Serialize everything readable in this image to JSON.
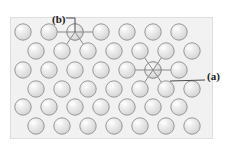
{
  "figure": {
    "kind": "atomic-lattice-diagram",
    "width": 231,
    "height": 156,
    "background_color": "#ffffff",
    "panel": {
      "x": 10,
      "y": 17,
      "width": 203,
      "height": 122,
      "fill_color": "#ebebeb",
      "border_color": "#cdcdcd",
      "texture": "fine vertical paper grain"
    }
  },
  "atoms": {
    "count": 41,
    "radius": 8.2,
    "fill_color": "#e2e2e2",
    "outline_color": "#8f8f8f",
    "highlight_color": "#fbfbfb",
    "lattice_type": "hexagonal close packed (2D)",
    "row_spacing": 19,
    "column_spacing": 26,
    "rows": [
      {
        "index": 0,
        "y": 32,
        "x_start": 23,
        "count": 7,
        "offset": 0
      },
      {
        "index": 1,
        "y": 51,
        "x_start": 36,
        "count": 7,
        "offset": 13
      },
      {
        "index": 2,
        "y": 70,
        "x_start": 23,
        "count": 7,
        "offset": 0
      },
      {
        "index": 3,
        "y": 89,
        "x_start": 36,
        "count": 7,
        "offset": 13
      },
      {
        "index": 4,
        "y": 107,
        "x_start": 23,
        "count": 7,
        "offset": 0
      },
      {
        "index": 5,
        "y": 126,
        "x_start": 36,
        "count": 7,
        "offset": 13
      }
    ]
  },
  "bonds": {
    "line_color": "#888888",
    "line_width": 1,
    "sites": [
      {
        "id": "site-b",
        "label": "(b)",
        "center_x": 75,
        "center_y": 32,
        "description": "adatom / surface site in top row with four visible bonds",
        "neighbor_directions": [
          "left",
          "right",
          "down-left",
          "down-right"
        ]
      },
      {
        "id": "site-a",
        "label": "(a)",
        "center_x": 153,
        "center_y": 70,
        "description": "fully coordinated interior site with six bonds",
        "neighbor_directions": [
          "left",
          "right",
          "up-left",
          "up-right",
          "down-left",
          "down-right"
        ]
      }
    ]
  },
  "callouts": [
    {
      "id": "callout-b",
      "label": "(b)",
      "label_x": 52,
      "label_y": 14,
      "leader": "elbow line: right from label, then straight down to atom",
      "target_x": 75,
      "target_y": 32,
      "line_color": "#4a4a4a"
    },
    {
      "id": "callout-a",
      "label": "(a)",
      "label_x": 207,
      "label_y": 71,
      "leader": "diagonal line up-left from label toward bond region",
      "target_x": 170,
      "target_y": 81,
      "line_color": "#4a4a4a"
    }
  ]
}
